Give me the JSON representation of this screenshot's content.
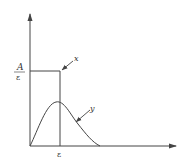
{
  "diagram": {
    "colors": {
      "stroke": "#444444",
      "text": "#333333",
      "background": "#ffffff"
    },
    "labels": {
      "level_numerator": "A",
      "level_denominator": "ε",
      "x_tick": "ε",
      "curve_x": "x",
      "curve_y": "y"
    },
    "elements": {
      "rectangular_pulse": "x",
      "smooth_pulse": "y"
    }
  }
}
